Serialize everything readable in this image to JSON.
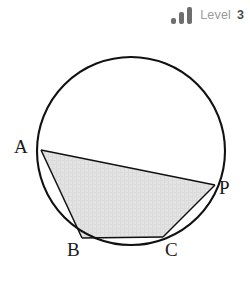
{
  "badge": {
    "level_word": "Level",
    "level_number": "3",
    "bars": [
      {
        "name": "bar-1",
        "height_rank": 1
      },
      {
        "name": "bar-2",
        "height_rank": 2
      },
      {
        "name": "bar-3",
        "height_rank": 3
      }
    ],
    "bar_color": "#6e6e6e",
    "word_color": "#9a9a9a",
    "number_color": "#4d4d4d"
  },
  "figure": {
    "type": "circle-with-inscribed-quadrilateral",
    "background": "#ffffff",
    "stroke_color": "#111111",
    "shade_color": "#e2e2e2",
    "circle": {
      "cx": 131,
      "cy": 151,
      "r": 94
    },
    "vertices": [
      {
        "label": "A",
        "x": 41,
        "y": 150
      },
      {
        "label": "B",
        "x": 82,
        "y": 238
      },
      {
        "label": "C",
        "x": 163,
        "y": 237
      },
      {
        "label": "P",
        "x": 215,
        "y": 185
      }
    ],
    "labels": {
      "A": "A",
      "B": "B",
      "C": "C",
      "P": "P"
    },
    "segments": [
      {
        "name": "chord-A-P",
        "from": "A",
        "to": "P"
      },
      {
        "name": "chord-A-B",
        "from": "A",
        "to": "B"
      },
      {
        "name": "chord-B-C",
        "from": "B",
        "to": "C"
      },
      {
        "name": "chord-C-P",
        "from": "C",
        "to": "P"
      }
    ]
  }
}
